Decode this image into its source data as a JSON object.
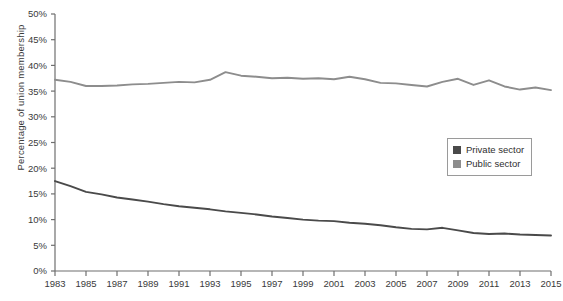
{
  "chart_data": {
    "type": "line",
    "title": "",
    "subtitle": "",
    "xlabel": "",
    "ylabel": "Percentage of union membership",
    "xlim": [
      1983,
      2015
    ],
    "ylim": [
      0,
      50
    ],
    "grid": false,
    "legend_position": "right-middle",
    "y_tick_labels": [
      "0%",
      "5%",
      "10%",
      "15%",
      "20%",
      "25%",
      "30%",
      "35%",
      "40%",
      "45%",
      "50%"
    ],
    "y_tick_values": [
      0,
      5,
      10,
      15,
      20,
      25,
      30,
      35,
      40,
      45,
      50
    ],
    "x_tick_labels": [
      "1983",
      "1985",
      "1987",
      "1989",
      "1991",
      "1993",
      "1995",
      "1997",
      "1999",
      "2001",
      "2003",
      "2005",
      "2007",
      "2009",
      "2011",
      "2013",
      "2015"
    ],
    "x_tick_values": [
      1983,
      1985,
      1987,
      1989,
      1991,
      1993,
      1995,
      1997,
      1999,
      2001,
      2003,
      2005,
      2007,
      2009,
      2011,
      2013,
      2015
    ],
    "x": [
      1983,
      1984,
      1985,
      1986,
      1987,
      1988,
      1989,
      1990,
      1991,
      1992,
      1993,
      1994,
      1995,
      1996,
      1997,
      1998,
      1999,
      2000,
      2001,
      2002,
      2003,
      2004,
      2005,
      2006,
      2007,
      2008,
      2009,
      2010,
      2011,
      2012,
      2013,
      2014,
      2015
    ],
    "series": [
      {
        "name": "Private sector",
        "color": "#4a4a4a",
        "values": [
          17.5,
          16.5,
          15.4,
          14.9,
          14.3,
          13.9,
          13.5,
          13.0,
          12.6,
          12.3,
          12.0,
          11.6,
          11.3,
          11.0,
          10.6,
          10.3,
          10.0,
          9.8,
          9.7,
          9.4,
          9.2,
          8.9,
          8.5,
          8.2,
          8.1,
          8.4,
          7.9,
          7.4,
          7.2,
          7.3,
          7.1,
          7.0,
          6.9
        ]
      },
      {
        "name": "Public sector",
        "color": "#8d8d8d",
        "values": [
          37.2,
          36.8,
          36.0,
          36.0,
          36.1,
          36.3,
          36.4,
          36.6,
          36.8,
          36.7,
          37.2,
          38.7,
          38.0,
          37.8,
          37.5,
          37.6,
          37.4,
          37.5,
          37.3,
          37.8,
          37.3,
          36.6,
          36.5,
          36.2,
          35.9,
          36.8,
          37.4,
          36.2,
          37.1,
          35.9,
          35.3,
          35.7,
          35.2
        ]
      }
    ]
  },
  "legend": {
    "items": [
      {
        "label": "Private sector",
        "color": "#4a4a4a"
      },
      {
        "label": "Public sector",
        "color": "#8d8d8d"
      }
    ]
  }
}
